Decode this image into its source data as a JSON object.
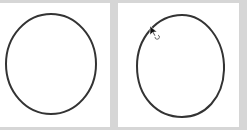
{
  "canvas": {
    "background": "#d6d6d6",
    "stroke_color": "#333333",
    "panels": [
      {
        "label": "original-circle",
        "shape": "ellipse"
      },
      {
        "label": "edited-shape",
        "shape": "egg"
      }
    ]
  },
  "cursor": {
    "icon": "pointer-with-rotate-icon",
    "x": 151,
    "y": 29
  }
}
